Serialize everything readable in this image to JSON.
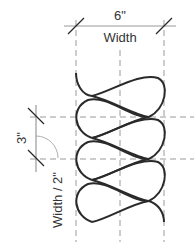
{
  "diagram": {
    "top_dimension": {
      "value": "6\"",
      "label": "Width"
    },
    "side_dimension": {
      "value": "3\"",
      "label": "Width / 2\""
    },
    "colors": {
      "stroke": "#2a2a2a",
      "guide": "#9a9a9a",
      "text": "#333333"
    }
  }
}
